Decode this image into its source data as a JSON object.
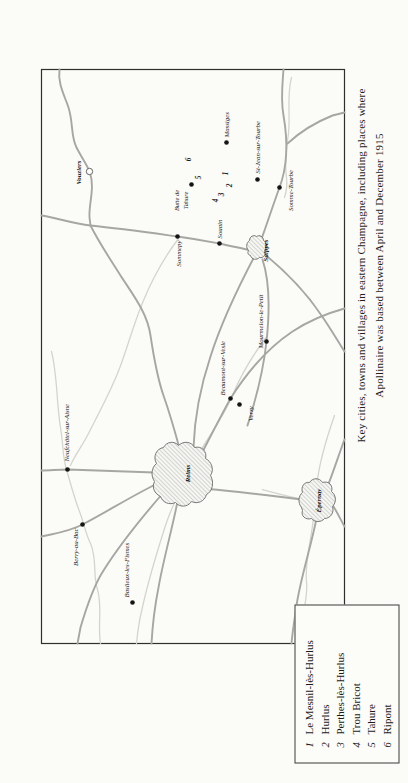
{
  "colors": {
    "paper": "#fbfbf8",
    "ink": "#1c1c1c",
    "road": "#a6a6a3",
    "river": "#d4d4cf",
    "border": "#2f2f2f",
    "hatch": "#909090"
  },
  "caption": {
    "line1": "Key cities, towns and villages in eastern Champagne, including places where",
    "line2": "Apollinaire was based between April and December 1915"
  },
  "legend": {
    "entries": [
      {
        "num": "1",
        "name": "Le Mesnil-lès-Hurlus"
      },
      {
        "num": "2",
        "name": "Hurlus"
      },
      {
        "num": "3",
        "name": "Perthes-lès-Hurlus"
      },
      {
        "num": "4",
        "name": "Trou Bricot"
      },
      {
        "num": "5",
        "name": "Tahure"
      },
      {
        "num": "6",
        "name": "Ripont"
      }
    ]
  },
  "map": {
    "towns": [
      {
        "label": "Vouziers",
        "bold": true
      },
      {
        "label": "Sommepy",
        "bold": false
      },
      {
        "label": "Souain",
        "bold": false
      },
      {
        "label": "Suippes",
        "bold": true
      },
      {
        "label": "Somme-Tourbe",
        "bold": false
      },
      {
        "label": "St-Jean-sur-Tourbe",
        "bold": false
      },
      {
        "label": "Massiges",
        "bold": false
      },
      {
        "label": "Mourmelon-le-Petit",
        "bold": false
      },
      {
        "label": "Beaumont-sur-Vesle",
        "bold": false
      },
      {
        "label": "Verzy",
        "bold": false
      },
      {
        "label": "Reims",
        "bold": true
      },
      {
        "label": "Neufchâtel-sur-Aisne",
        "bold": false
      },
      {
        "label": "Berry-au-Bac",
        "bold": false
      },
      {
        "label": "Baslieux-les-Fismes",
        "bold": false
      },
      {
        "label": "Épernay",
        "bold": true
      }
    ],
    "area_labels": [
      {
        "label": "Butte de"
      },
      {
        "label": "Tahure"
      }
    ],
    "site_numbers": [
      "1",
      "2",
      "3",
      "4",
      "5",
      "6"
    ]
  }
}
